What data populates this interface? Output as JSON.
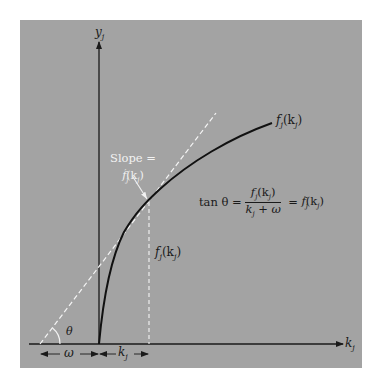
{
  "diagram": {
    "colors": {
      "background": "#ffffff",
      "panel": "#a3a3a3",
      "axis": "#1a1a1a",
      "curve": "#111111",
      "tangent_line": "#f5f5f5",
      "white_label": "#f2f2f2"
    },
    "axes": {
      "y_label": "y",
      "y_sub": "j",
      "x_label": "k",
      "x_sub": "j"
    },
    "curve_label": {
      "f": "f",
      "sub": "j",
      "arg": "(k",
      "arg_sub": "j",
      "close": ")"
    },
    "slope_label": {
      "line1": "Slope =",
      "line2_f": "f",
      "line2_sub": "j",
      "line2_prime": "′",
      "line2_arg": "(k",
      "line2_arg_sub": "j",
      "line2_close": ")"
    },
    "height_label": {
      "f": "f",
      "sub": "j",
      "arg": "(k",
      "arg_sub": "j",
      "close": ")"
    },
    "angle_label": "θ",
    "omega_label": "ω",
    "kj_label": {
      "k": "k",
      "sub": "j"
    },
    "formula": {
      "lhs": "tan θ =",
      "num_f": "f",
      "num_sub": "j",
      "num_arg": "(k",
      "num_arg_sub": "j",
      "num_close": ")",
      "den_k": "k",
      "den_sub": "j",
      "den_rest": " + ω",
      "eq2": " = ",
      "rhs_f": "f",
      "rhs_sub": "j",
      "rhs_prime": "′",
      "rhs_arg": "(k",
      "rhs_arg_sub": "j",
      "rhs_close": ")"
    }
  }
}
